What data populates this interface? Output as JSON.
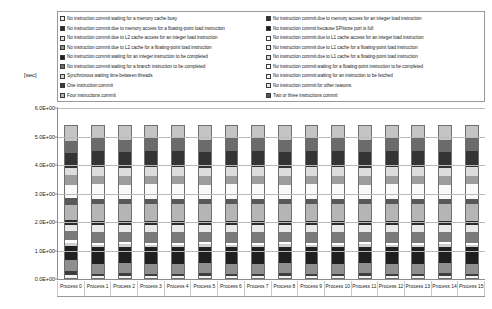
{
  "chart_data": {
    "type": "bar",
    "stacked": true,
    "title": "",
    "xlabel": "",
    "ylabel": "[sec]",
    "ylim": [
      0,
      6
    ],
    "ytick_labels": [
      "0.0E+00",
      "1.0E+00",
      "2.0E+00",
      "3.0E+00",
      "4.0E+00",
      "5.0E+00",
      "6.0E+00"
    ],
    "ytick_values": [
      0,
      1,
      2,
      3,
      4,
      5,
      6
    ],
    "grid": true,
    "legend_position": "top",
    "categories": [
      "Process 0",
      "Process 1",
      "Process 2",
      "Process 3",
      "Process 4",
      "Process 5",
      "Process 6",
      "Process 7",
      "Process 8",
      "Process 9",
      "Process 10",
      "Process 11",
      "Process 12",
      "Process 13",
      "Process 14",
      "Process 15"
    ],
    "series": [
      {
        "name": "No instruction commit waiting for a memory cache busy",
        "color": "#f2f2f2",
        "values": [
          0.1,
          0.06,
          0.07,
          0.06,
          0.06,
          0.07,
          0.06,
          0.06,
          0.07,
          0.06,
          0.06,
          0.07,
          0.06,
          0.06,
          0.07,
          0.06
        ]
      },
      {
        "name": "No instruction commit due to memory access for an integer load instruction",
        "color": "#3d3d3d",
        "values": [
          0.14,
          0.1,
          0.11,
          0.1,
          0.1,
          0.11,
          0.1,
          0.1,
          0.11,
          0.1,
          0.1,
          0.11,
          0.1,
          0.1,
          0.11,
          0.1
        ]
      },
      {
        "name": "No instruction commit due to memory access for a floating-point load instruction",
        "color": "#8f8f8f",
        "values": [
          0.4,
          0.34,
          0.35,
          0.34,
          0.34,
          0.35,
          0.34,
          0.34,
          0.35,
          0.34,
          0.34,
          0.35,
          0.34,
          0.34,
          0.35,
          0.34
        ]
      },
      {
        "name": "No instruction commit because SP/store port is full",
        "color": "#1f1f1f",
        "values": [
          0.5,
          0.6,
          0.58,
          0.6,
          0.6,
          0.58,
          0.6,
          0.6,
          0.58,
          0.6,
          0.6,
          0.58,
          0.6,
          0.6,
          0.58,
          0.6
        ]
      },
      {
        "name": "No instruction commit due to L2 cache access for an integer load instruction",
        "color": "#cfcfcf",
        "values": [
          0.12,
          0.09,
          0.1,
          0.09,
          0.09,
          0.1,
          0.09,
          0.09,
          0.1,
          0.09,
          0.09,
          0.1,
          0.09,
          0.09,
          0.1,
          0.09
        ]
      },
      {
        "name": "No instruction commit due to L1 cache access for an integer load instruction",
        "color": "#ffffff",
        "values": [
          0.1,
          0.07,
          0.08,
          0.07,
          0.07,
          0.08,
          0.07,
          0.07,
          0.08,
          0.07,
          0.07,
          0.08,
          0.07,
          0.07,
          0.08,
          0.07
        ]
      },
      {
        "name": "No instruction commit due to L2 cache for a floating-point load instruction",
        "color": "#7a7a7a",
        "values": [
          0.3,
          0.36,
          0.34,
          0.36,
          0.36,
          0.34,
          0.36,
          0.36,
          0.34,
          0.36,
          0.36,
          0.34,
          0.36,
          0.36,
          0.34,
          0.36
        ]
      },
      {
        "name": "No instruction commit due to L1 cache for a floating-point load instruction",
        "color": "#e8e8e8",
        "values": [
          0.22,
          0.26,
          0.25,
          0.26,
          0.26,
          0.25,
          0.26,
          0.26,
          0.25,
          0.26,
          0.26,
          0.25,
          0.26,
          0.26,
          0.25,
          0.26
        ]
      },
      {
        "name": "No instruction commit waiting for an integer instruction to be completed",
        "color": "#2b2b2b",
        "values": [
          0.18,
          0.13,
          0.14,
          0.13,
          0.13,
          0.14,
          0.13,
          0.13,
          0.14,
          0.13,
          0.13,
          0.14,
          0.13,
          0.13,
          0.14,
          0.13
        ]
      },
      {
        "name": "No instruction commit waiting for a floating-point instruction to be completed",
        "color": "#b5b5b5",
        "values": [
          0.55,
          0.62,
          0.6,
          0.62,
          0.62,
          0.6,
          0.62,
          0.62,
          0.6,
          0.62,
          0.62,
          0.6,
          0.62,
          0.62,
          0.6,
          0.62
        ]
      },
      {
        "name": "No instruction commit waiting for a branch instruction to be completed",
        "color": "#585858",
        "values": [
          0.24,
          0.18,
          0.19,
          0.18,
          0.18,
          0.19,
          0.18,
          0.18,
          0.19,
          0.18,
          0.18,
          0.19,
          0.18,
          0.18,
          0.19,
          0.18
        ]
      },
      {
        "name": "No instruction commit waiting for an instruction to be fetched",
        "color": "#fafafa",
        "values": [
          0.45,
          0.52,
          0.5,
          0.52,
          0.52,
          0.5,
          0.52,
          0.52,
          0.5,
          0.52,
          0.52,
          0.5,
          0.52,
          0.52,
          0.5,
          0.52
        ]
      },
      {
        "name": "Synchronous waiting time between threads",
        "color": "#9c9c9c",
        "values": [
          0.36,
          0.3,
          0.31,
          0.3,
          0.3,
          0.31,
          0.3,
          0.3,
          0.31,
          0.3,
          0.3,
          0.31,
          0.3,
          0.3,
          0.31,
          0.3
        ]
      },
      {
        "name": "No instruction commit for other reasons",
        "color": "#dcdcdc",
        "values": [
          0.26,
          0.3,
          0.29,
          0.3,
          0.3,
          0.29,
          0.3,
          0.3,
          0.29,
          0.3,
          0.3,
          0.29,
          0.3,
          0.3,
          0.29,
          0.3
        ]
      },
      {
        "name": "One instruction commit",
        "color": "#333333",
        "values": [
          0.52,
          0.58,
          0.56,
          0.58,
          0.58,
          0.56,
          0.58,
          0.58,
          0.56,
          0.58,
          0.58,
          0.56,
          0.58,
          0.58,
          0.56,
          0.58
        ]
      },
      {
        "name": "Two or three instructions commit",
        "color": "#6b6b6b",
        "values": [
          0.42,
          0.46,
          0.45,
          0.46,
          0.46,
          0.45,
          0.46,
          0.46,
          0.45,
          0.46,
          0.46,
          0.45,
          0.46,
          0.46,
          0.45,
          0.46
        ]
      },
      {
        "name": "Four instructions commit",
        "color": "#c4c4c4",
        "values": [
          0.54,
          0.43,
          0.48,
          0.43,
          0.43,
          0.48,
          0.43,
          0.43,
          0.48,
          0.43,
          0.43,
          0.48,
          0.43,
          0.43,
          0.48,
          0.43
        ]
      }
    ]
  },
  "legend": {
    "left_column": [
      {
        "label": "No instruction commit waiting for a memory cache busy",
        "color": "#f2f2f2"
      },
      {
        "label": "No instruction commit due to memory access for a floating-point load instruction",
        "color": "#2b2b2b"
      },
      {
        "label": "No instruction commit due to L2 cache access for an integer load instruction",
        "color": "#e0e0e0"
      },
      {
        "label": "No instruction commit due to L2 cache for a floating-point load instruction",
        "color": "#8f8f8f"
      },
      {
        "label": "No instruction commit waiting for an integer instruction to be completed",
        "color": "#1f1f1f"
      },
      {
        "label": "No instruction commit waiting for a branch instruction to be completed",
        "color": "#6b6b6b"
      },
      {
        "label": "Synchronous waiting time between threads",
        "color": "#cfcfcf"
      },
      {
        "label": "One instruction commit",
        "color": "#3d3d3d"
      },
      {
        "label": "Four instructions commit",
        "color": "#b5b5b5"
      }
    ],
    "right_column": [
      {
        "label": "No instruction commit due to memory access for an integer load instruction",
        "color": "#333333"
      },
      {
        "label": "No instruction commit because SP/store port is full",
        "color": "#1a1a1a"
      },
      {
        "label": "No instruction commit due to L1 cache access for an integer load instruction",
        "color": "#ffffff"
      },
      {
        "label": "No instruction commit due to L1 cache for a floating-point load instruction",
        "color": "#ededed"
      },
      {
        "label": "No instruction commit due to L1 cache for a floating-point load instruction ",
        "color": "#dcdcdc"
      },
      {
        "label": "No instruction commit waiting for a floating-point instruction to be completed",
        "color": "#fafafa"
      },
      {
        "label": "No instruction commit waiting for an instruction to be fetched",
        "color": "#f5f5f5"
      },
      {
        "label": "No instruction commit for other reasons",
        "color": "#e8e8e8"
      },
      {
        "label": "Two or three instructions commit",
        "color": "#555555"
      }
    ]
  },
  "axis": {
    "unit": "[sec]"
  }
}
